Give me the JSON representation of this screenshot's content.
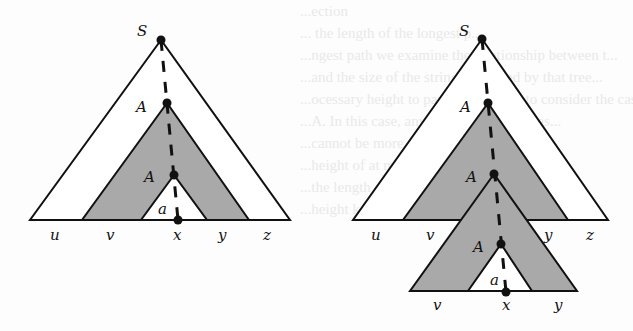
{
  "figure": {
    "left_tree": {
      "root_label": "S",
      "upper_nonterminal_label": "A",
      "lower_nonterminal_label": "A",
      "terminal_label": "a",
      "yield_labels": [
        "u",
        "v",
        "x",
        "y",
        "z"
      ]
    },
    "right_tree": {
      "root_label": "S",
      "nonterminal_labels": [
        "A",
        "A",
        "A"
      ],
      "terminal_label": "a",
      "upper_yield_labels": [
        "u",
        "v",
        "y",
        "z"
      ],
      "lower_yield_labels": [
        "v",
        "x",
        "y"
      ]
    },
    "colors": {
      "stroke": "#111111",
      "shaded_fill": "#a9a9a9",
      "inner_fill": "#ffffff"
    }
  },
  "background_bleed_text": [
    "...ection",
    "... the length of the longest p...",
    "...ngest path we examine the relationship between t...",
    "...and the size of the string generated by that tree...",
    "...ocessary height to parse. It suffices to consider the case wh...",
    "...A. In this case, any generated string has...",
    "...cannot be more than 2 and the...",
    "...height of at most...",
    "...the length of the generated string...",
    "...height k, at most 2^k..."
  ]
}
